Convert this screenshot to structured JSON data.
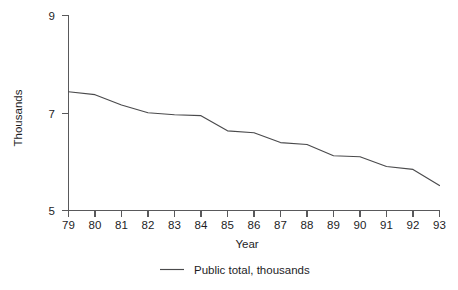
{
  "chart_data": {
    "type": "line",
    "title": "",
    "xlabel": "Year",
    "ylabel": "Thousands",
    "categories": [
      "79",
      "80",
      "81",
      "82",
      "83",
      "84",
      "85",
      "86",
      "87",
      "88",
      "89",
      "90",
      "91",
      "92",
      "93"
    ],
    "x": [
      79,
      80,
      81,
      82,
      83,
      84,
      85,
      86,
      87,
      88,
      89,
      90,
      91,
      92,
      93
    ],
    "series": [
      {
        "name": "Public total, thousands",
        "values": [
          7.43,
          7.37,
          7.16,
          7.0,
          6.96,
          6.94,
          6.63,
          6.59,
          6.39,
          6.35,
          6.12,
          6.1,
          5.9,
          5.84,
          5.51
        ],
        "color": "#4a4a4c"
      }
    ],
    "xlim": [
      79,
      93
    ],
    "ylim": [
      5,
      9
    ],
    "yticks": [
      "5",
      "7",
      "9"
    ],
    "ytick_values": [
      5,
      7,
      9
    ],
    "xticks": [
      "79",
      "80",
      "81",
      "82",
      "83",
      "84",
      "85",
      "86",
      "87",
      "88",
      "89",
      "90",
      "91",
      "92",
      "93"
    ],
    "grid": false,
    "legend_position": "bottom",
    "legend": [
      {
        "label": "Public total, thousands",
        "color": "#4a4a4c"
      }
    ]
  },
  "axes": {
    "y_title": "Thousands",
    "x_title": "Year",
    "y_tick_labels": [
      "9",
      "7",
      "5"
    ],
    "x_tick_labels": [
      "79",
      "80",
      "81",
      "82",
      "83",
      "84",
      "85",
      "86",
      "87",
      "88",
      "89",
      "90",
      "91",
      "92",
      "93"
    ]
  },
  "legend": {
    "entry_label": "Public total, thousands"
  },
  "colors": {
    "axis": "#59595b",
    "series": "#4a4a4c",
    "text": "#1d1d1f",
    "background": "#ffffff"
  }
}
